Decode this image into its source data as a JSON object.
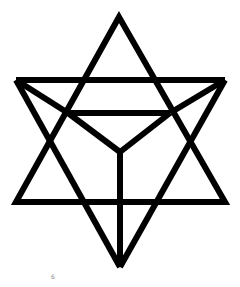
{
  "diagram": {
    "stroke_color": "#000000",
    "background": "#ffffff",
    "stroke_width": 6,
    "shapes": {
      "upward_triangle": {
        "apex": [
          119,
          17
        ],
        "left": [
          16,
          202
        ],
        "right": [
          225,
          202
        ]
      },
      "downward_triangle": {
        "left": [
          16,
          80
        ],
        "right": [
          225,
          80
        ],
        "apex": [
          120,
          267
        ]
      },
      "inner_edges": [
        {
          "from": [
            68,
            113
          ],
          "to": [
            170,
            113
          ]
        },
        {
          "from": [
            68,
            113
          ],
          "to": [
            120,
            152
          ]
        },
        {
          "from": [
            170,
            113
          ],
          "to": [
            120,
            152
          ]
        },
        {
          "from": [
            120,
            152
          ],
          "to": [
            120,
            267
          ]
        },
        {
          "from": [
            16,
            80
          ],
          "to": [
            68,
            113
          ]
        },
        {
          "from": [
            225,
            80
          ],
          "to": [
            170,
            113
          ]
        },
        {
          "from": [
            68,
            113
          ],
          "to": [
            120,
            202
          ]
        },
        {
          "from": [
            170,
            113
          ],
          "to": [
            120,
            202
          ]
        }
      ]
    }
  },
  "footer_mark": "6"
}
